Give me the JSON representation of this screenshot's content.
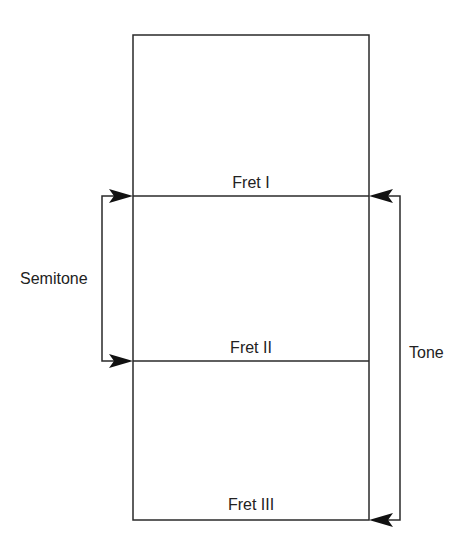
{
  "diagram": {
    "frets": [
      {
        "label": "Fret I"
      },
      {
        "label": "Fret II"
      },
      {
        "label": "Fret III"
      }
    ],
    "intervals": {
      "semitone": {
        "label": "Semitone"
      },
      "tone": {
        "label": "Tone"
      }
    },
    "colors": {
      "line": "#2a2a2a",
      "text": "#222222",
      "background": "#ffffff"
    }
  }
}
